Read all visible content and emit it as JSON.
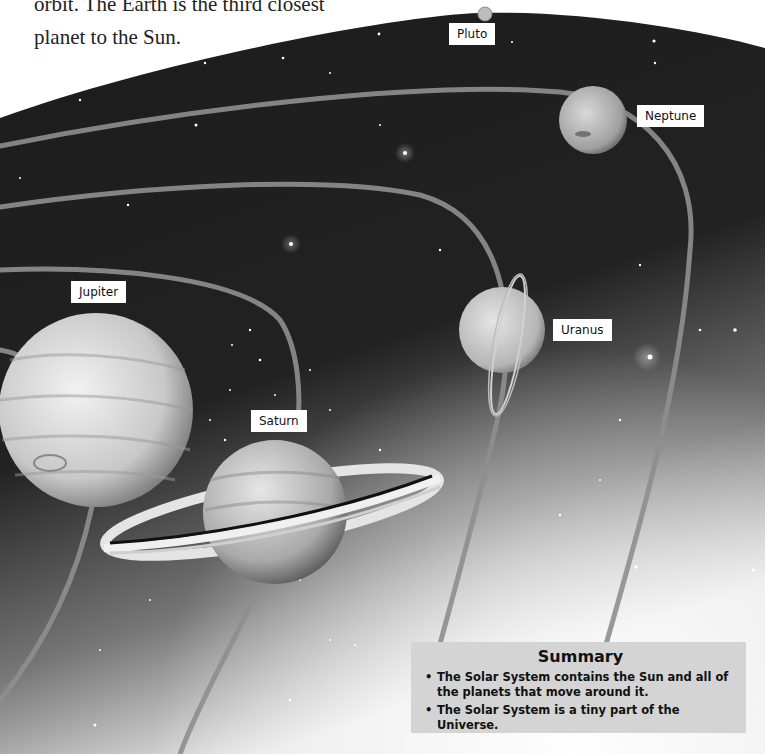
{
  "intro": {
    "lines": [
      "orbit. The Earth is the third closest",
      "planet to the Sun."
    ]
  },
  "labels": {
    "pluto": "Pluto",
    "neptune": "Neptune",
    "uranus": "Uranus",
    "jupiter": "Jupiter",
    "saturn": "Saturn"
  },
  "summary": {
    "title": "Summary",
    "bullet_icon": "•",
    "items": [
      "The Solar System contains the Sun and all of the planets that move around it.",
      "The Solar System is a tiny part of the Universe."
    ]
  },
  "colors": {
    "space": "#1a1a1a",
    "orbit": "#8a8a8a",
    "label_bg": "#ffffff",
    "summary_bg": "#d4d4d4"
  }
}
